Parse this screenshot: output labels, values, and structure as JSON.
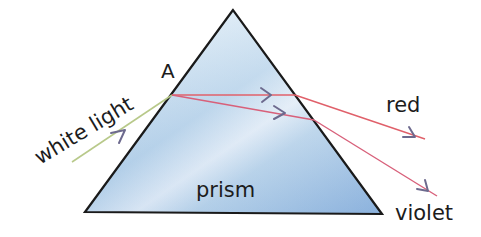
{
  "diagram": {
    "labels": {
      "incident": "white light",
      "entry_point": "A",
      "prism": "prism",
      "ray_red": "red",
      "ray_violet": "violet"
    },
    "colors": {
      "prism_fill_light": "#e6f1f9",
      "prism_fill_mid": "#bcd7ec",
      "prism_fill_dark": "#8fb5df",
      "prism_edge": "#1a1a1a",
      "incident_ray": "#b8c98a",
      "red_ray": "#e0606a",
      "violet_ray": "#d8607a",
      "arrow_head": "#6d6a8e",
      "text": "#1c1c1c"
    }
  }
}
